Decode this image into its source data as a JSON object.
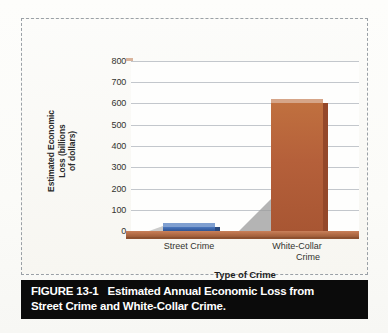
{
  "figure": {
    "caption_label": "FIGURE 13-1",
    "caption_line1": "Estimated Annual Economic Loss from",
    "caption_line2": "Street Crime and White-Collar Crime."
  },
  "chart_data": {
    "type": "bar",
    "title": "",
    "categories": [
      "Street Crime",
      "White-Collar Crime"
    ],
    "values": [
      17,
      600
    ],
    "xlabel": "Type of Crime",
    "ylabel": "Estimated Economic Loss (billions of dollars)",
    "ylabel_lines": [
      "Estimated Economic",
      "Loss (billions",
      "of dollars)"
    ],
    "category_label_lines": [
      [
        "Street Crime"
      ],
      [
        "White-Collar",
        "Crime"
      ]
    ],
    "ylim": [
      0,
      800
    ],
    "ytick_step": 100,
    "yticks": [
      800,
      700,
      600,
      500,
      400,
      300,
      200,
      100,
      0
    ],
    "grid": true,
    "legend": "none",
    "bar_colors": [
      "#3A63A8",
      "#B5603A"
    ],
    "style": "3d-column"
  }
}
